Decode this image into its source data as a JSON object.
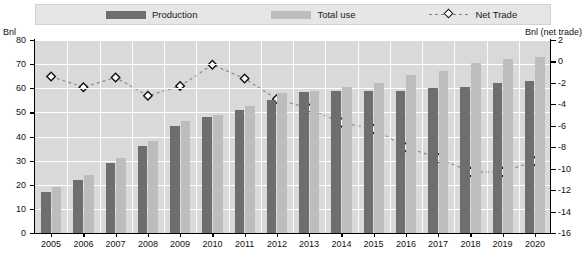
{
  "legend": {
    "items": [
      {
        "label": "Production",
        "type": "bar",
        "color": "#6e6e6e",
        "icon": "bar-swatch-icon"
      },
      {
        "label": "Total use",
        "type": "bar",
        "color": "#bdbdbd",
        "icon": "bar-swatch-icon"
      },
      {
        "label": "Net Trade",
        "type": "line-marker",
        "color": "#7d7d7d",
        "icon": "diamond-marker-icon"
      }
    ]
  },
  "axes": {
    "y_left_title": "Bnl",
    "y_right_title": "Bnl (net trade)",
    "y_left_ticks": [
      "0",
      "10",
      "20",
      "30",
      "40",
      "50",
      "60",
      "70",
      "80"
    ],
    "y_right_ticks": [
      "-16",
      "-14",
      "-12",
      "-10",
      "-8",
      "-6",
      "-4",
      "-2",
      "0",
      "2"
    ],
    "y_left_range": [
      0,
      80
    ],
    "y_right_range": [
      -16,
      2
    ]
  },
  "chart_data": {
    "type": "bar",
    "title": "",
    "xlabel": "",
    "ylabel": "Bnl",
    "y2label": "Bnl (net trade)",
    "ylim": [
      0,
      80
    ],
    "y2lim": [
      -16,
      2
    ],
    "grid": true,
    "legend_position": "top",
    "categories": [
      "2005",
      "2006",
      "2007",
      "2008",
      "2009",
      "2010",
      "2011",
      "2012",
      "2013",
      "2014",
      "2015",
      "2016",
      "2017",
      "2018",
      "2019",
      "2020"
    ],
    "series": [
      {
        "name": "Production",
        "type": "bar",
        "axis": "left",
        "color": "#6e6e6e",
        "values": [
          17,
          22,
          29,
          36,
          44.5,
          48,
          51,
          55,
          58.5,
          59,
          59,
          59,
          60,
          60.5,
          62,
          63
        ]
      },
      {
        "name": "Total use",
        "type": "bar",
        "axis": "left",
        "color": "#bdbdbd",
        "values": [
          19,
          24,
          31,
          38,
          46.5,
          49,
          52.5,
          58,
          59,
          60.5,
          62,
          65.5,
          67,
          70.5,
          72,
          73
        ]
      },
      {
        "name": "Net Trade",
        "type": "line",
        "axis": "right",
        "color": "#7d7d7d",
        "marker": "diamond",
        "values": [
          -1.4,
          -2.4,
          -1.5,
          -3.2,
          -2.3,
          -0.3,
          -1.6,
          -3.5,
          -4.4,
          -5.7,
          -6.3,
          -8.0,
          -9.0,
          -10.3,
          -10.3,
          -9.3
        ]
      }
    ]
  }
}
